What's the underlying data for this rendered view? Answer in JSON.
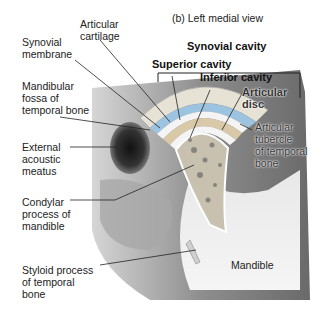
{
  "figure": {
    "title": "(b) Left medial view",
    "labels": {
      "articular_cartilage": "Articular\ncartilage",
      "synovial_membrane": "Synovial\nmembrane",
      "mandibular_fossa": "Mandibular\nfossa of\ntemporal bone",
      "external_acoustic_meatus": "External\nacoustic\nmeatus",
      "condylar_process": "Condylar\nprocess of\nmandible",
      "styloid_process": "Styloid process\nof temporal\nbone",
      "synovial_cavity": "Synovial cavity",
      "superior_cavity": "Superior cavity",
      "inferior_cavity": "Inferior cavity",
      "articular_disc": "Articular\ndisc",
      "articular_tubercle": "Articular\ntubercle\nof temporal\nbone",
      "mandible": "Mandible"
    }
  },
  "colors": {
    "bone_gray": "#9a9a9a",
    "cartilage_blue": "#9cc3df",
    "disc_tan": "#d9c9a8",
    "cavity_white": "#f4f4f4",
    "spongy_bone": "#c8c1b0"
  }
}
